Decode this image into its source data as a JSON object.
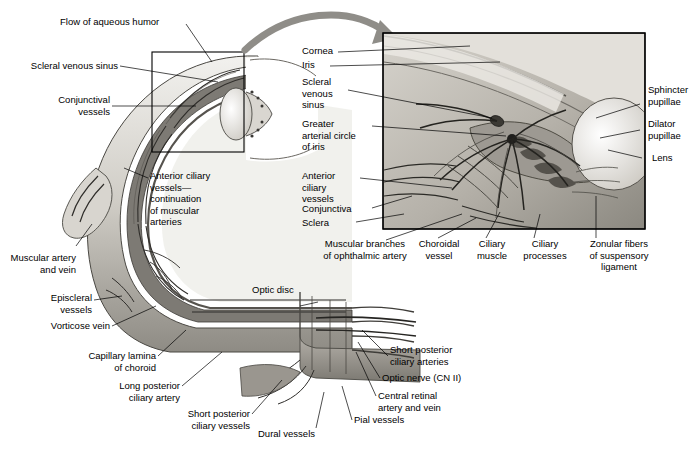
{
  "figure": {
    "colors": {
      "ink": "#000000",
      "background": "#ffffff",
      "tissue_light": "#e8e6e1",
      "tissue_mid": "#b9b5ad",
      "tissue_dark": "#6e6b65",
      "vessel_dark": "#3a3835",
      "inset_bg": "#c9c6bf",
      "arrow": "#8f8d88"
    }
  },
  "main_labels": {
    "flow_of_aqueous_humor": "Flow of aqueous humor",
    "scleral_venous_sinus": "Scleral venous sinus",
    "conjunctival_vessels": "Conjunctival\nvessels",
    "anterior_ciliary_vessels": "Anterior ciliary\nvessels—\ncontinuation\nof muscular\narteries",
    "muscular_artery_and_vein": "Muscular artery\nand vein",
    "episcleral_vessels": "Episcleral\nvessels",
    "vorticose_vein": "Vorticose vein",
    "capillary_lamina_of_choroid": "Capillary lamina\nof choroid",
    "long_posterior_ciliary_artery": "Long posterior\nciliary artery",
    "short_posterior_ciliary_vessels": "Short posterior\nciliary vessels",
    "dural_vessels": "Dural vessels",
    "pial_vessels": "Pial vessels",
    "central_retinal_artery_and_vein": "Central retinal\nartery and vein",
    "optic_nerve": "Optic nerve (CN II)",
    "short_posterior_ciliary_arteries": "Short posterior\nciliary arteries",
    "optic_disc": "Optic disc"
  },
  "inset_labels": {
    "cornea": "Cornea",
    "iris": "Iris",
    "scleral_venous_sinus": "Scleral\nvenous\nsinus",
    "greater_arterial_circle_of_iris": "Greater\narterial circle\nof iris",
    "anterior_ciliary_vessels": "Anterior\nciliary\nvessels",
    "conjunctiva": "Conjunctiva",
    "sclera": "Sclera",
    "sphincter_pupillae": "Sphincter\npupillae",
    "dilator_pupillae": "Dilator\npupillae",
    "lens": "Lens",
    "muscular_branches_of_ophthalmic_artery": "Muscular branches\nof ophthalmic artery",
    "choroidal_vessel": "Choroidal\nvessel",
    "ciliary_muscle": "Ciliary\nmuscle",
    "ciliary_processes": "Ciliary\nprocesses",
    "zonular_fibers": "Zonular fibers\nof suspensory\nligament"
  }
}
